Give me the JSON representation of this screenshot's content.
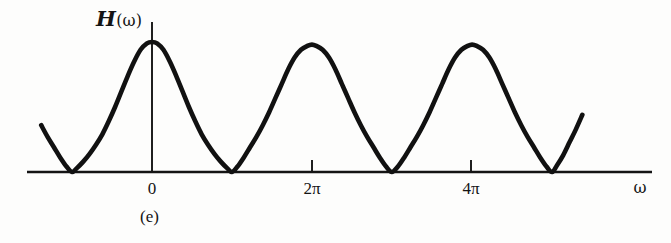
{
  "figure": {
    "panel_caption": "(e)",
    "y_axis_label": {
      "symbol": "H",
      "argument": "(ω)",
      "full": "H(ω)"
    },
    "x_axis_label": "ω",
    "background_color": "#fdfdfc",
    "ink_color": "#141414",
    "curve_color": "#111111"
  },
  "chart_data": {
    "type": "line",
    "title": "",
    "subtitle": "",
    "xlabel": "ω",
    "ylabel": "H(ω)",
    "grid": false,
    "legend": null,
    "annotations": [
      "(e)"
    ],
    "period": "2π",
    "xlim": [
      -4.4,
      8.6
    ],
    "ylim": [
      0,
      1.08
    ],
    "xticks": [
      0,
      6.283185,
      12.566371
    ],
    "xtick_labels": [
      "0",
      "2π",
      "4π"
    ],
    "yticks": [],
    "ytick_labels": [],
    "peaks": [
      {
        "x": 0,
        "x_label": "0",
        "y": 1.0
      },
      {
        "x": 6.283185,
        "x_label": "2π",
        "y": 0.98
      },
      {
        "x": 12.566371,
        "x_label": "4π",
        "y": 0.98
      }
    ],
    "zeros": [
      {
        "x": -3.141593,
        "x_label": "-π",
        "y": 0
      },
      {
        "x": 3.141593,
        "x_label": "π",
        "y": 0
      },
      {
        "x": 9.424778,
        "x_label": "3π",
        "y": 0
      },
      {
        "x": 15.707963,
        "x_label": "5π",
        "y": 0
      }
    ],
    "series": [
      {
        "name": "H(ω)",
        "x": [
          -4.35,
          -4.1,
          -3.85,
          -3.6,
          -3.35,
          -3.14,
          -2.95,
          -2.7,
          -2.45,
          -2.2,
          -1.95,
          -1.7,
          -1.45,
          -1.2,
          -0.95,
          -0.7,
          -0.45,
          -0.2,
          0.0,
          0.2,
          0.45,
          0.7,
          0.95,
          1.2,
          1.45,
          1.7,
          1.95,
          2.2,
          2.45,
          2.7,
          2.95,
          3.14,
          3.35,
          3.6,
          3.85,
          4.1,
          4.35,
          4.6,
          4.85,
          5.1,
          5.35,
          5.6,
          5.85,
          6.1,
          6.28,
          6.45,
          6.7,
          6.95,
          7.2,
          7.45,
          7.7,
          7.95,
          8.2,
          8.45,
          8.7,
          8.95,
          9.2,
          9.42,
          9.65,
          9.9,
          10.15,
          10.4,
          10.65,
          10.9,
          11.15,
          11.4,
          11.65,
          11.9,
          12.15,
          12.4,
          12.57,
          12.75,
          13.0,
          13.25,
          13.5,
          13.75,
          14.0,
          14.25,
          14.5,
          14.75,
          15.0,
          15.25,
          15.5,
          15.71,
          15.9,
          16.15,
          16.4,
          16.65,
          16.9
        ],
        "y": [
          0.36,
          0.27,
          0.19,
          0.11,
          0.04,
          0.0,
          0.03,
          0.08,
          0.14,
          0.21,
          0.29,
          0.39,
          0.5,
          0.62,
          0.74,
          0.85,
          0.94,
          0.99,
          1.0,
          0.99,
          0.94,
          0.85,
          0.74,
          0.62,
          0.5,
          0.39,
          0.29,
          0.21,
          0.14,
          0.08,
          0.03,
          0.0,
          0.04,
          0.11,
          0.19,
          0.27,
          0.36,
          0.46,
          0.57,
          0.68,
          0.79,
          0.88,
          0.94,
          0.97,
          0.98,
          0.97,
          0.94,
          0.88,
          0.79,
          0.68,
          0.57,
          0.46,
          0.36,
          0.27,
          0.19,
          0.11,
          0.04,
          0.0,
          0.04,
          0.11,
          0.19,
          0.27,
          0.36,
          0.46,
          0.57,
          0.68,
          0.79,
          0.88,
          0.94,
          0.97,
          0.98,
          0.97,
          0.94,
          0.88,
          0.79,
          0.68,
          0.57,
          0.46,
          0.36,
          0.27,
          0.19,
          0.11,
          0.04,
          0.0,
          0.05,
          0.13,
          0.23,
          0.33,
          0.44
        ]
      }
    ]
  },
  "axes": {
    "x_axis": {
      "x_start_px": 27,
      "x_end_px": 652,
      "y_px": 172
    },
    "y_axis": {
      "x_px": 152,
      "y_top_px": 22,
      "y_bottom_px": 172
    },
    "ticks": [
      {
        "label": "0",
        "x_px": 152,
        "has_mark": false
      },
      {
        "label": "2π",
        "x_px": 312,
        "has_mark": true
      },
      {
        "label": "4π",
        "x_px": 471,
        "has_mark": true
      }
    ]
  }
}
